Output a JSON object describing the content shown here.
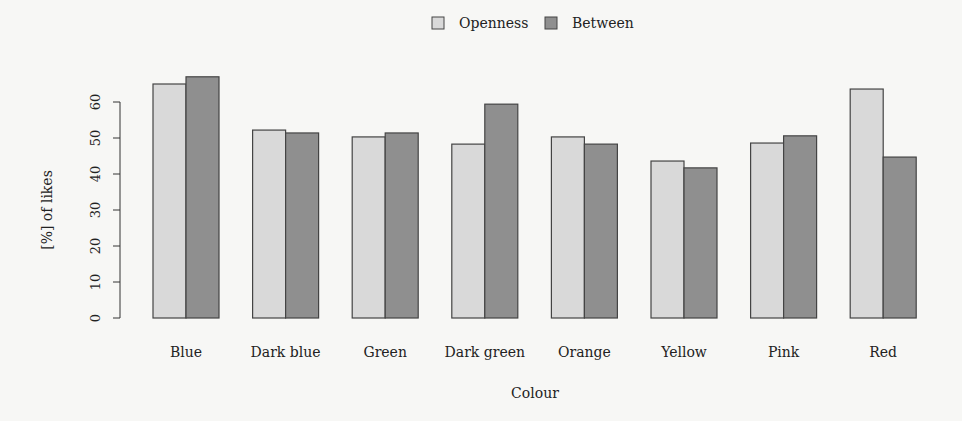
{
  "chart_data": {
    "type": "bar",
    "title": "",
    "xlabel": "Colour",
    "ylabel": "[%] of likes",
    "ylim": [
      0,
      60
    ],
    "yticks": [
      0,
      10,
      20,
      30,
      40,
      50,
      60
    ],
    "grid": false,
    "legend_position": "top",
    "categories": [
      "Blue",
      "Dark blue",
      "Green",
      "Dark green",
      "Orange",
      "Yellow",
      "Pink",
      "Red"
    ],
    "series": [
      {
        "name": "Openness",
        "color": "#d9d9d9",
        "values": [
          65.0,
          52.2,
          50.3,
          48.3,
          50.3,
          43.6,
          48.6,
          63.6
        ]
      },
      {
        "name": "Between",
        "color": "#8f8f8f",
        "values": [
          67.0,
          51.4,
          51.4,
          59.4,
          48.3,
          41.7,
          50.6,
          44.7
        ]
      }
    ]
  },
  "legend": {
    "items": [
      {
        "label": "Openness"
      },
      {
        "label": "Between"
      }
    ]
  },
  "axes": {
    "x_title": "Colour",
    "y_title": "[%] of likes"
  }
}
